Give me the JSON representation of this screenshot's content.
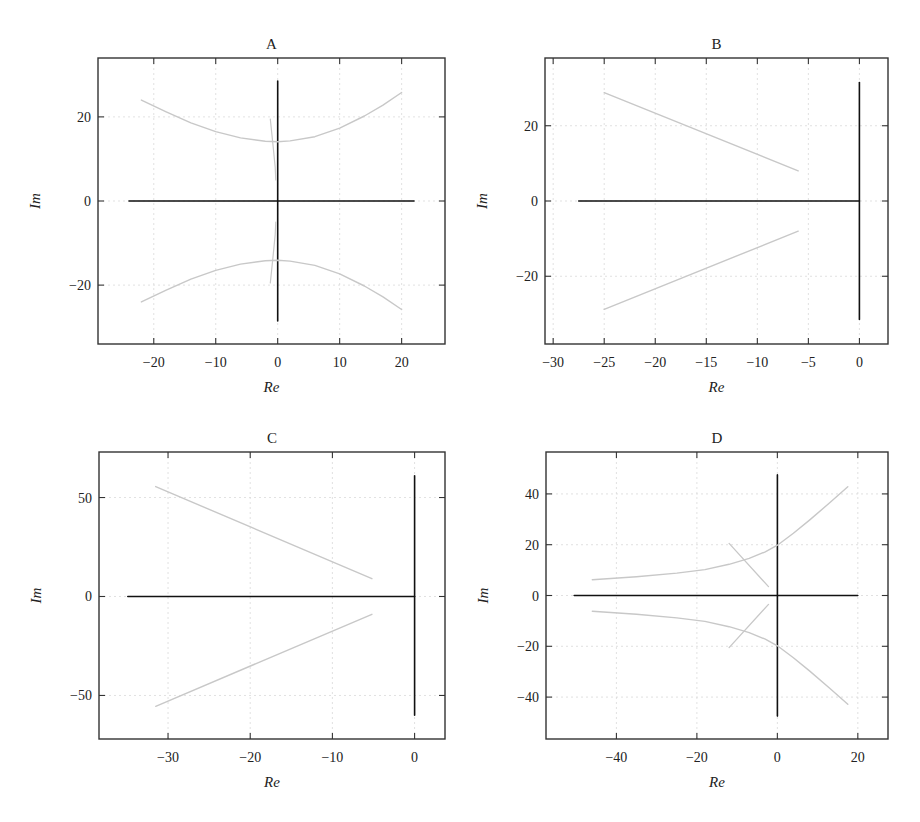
{
  "figure": {
    "background": "#ffffff",
    "frame_color": "#333333",
    "grid_color": "#d9d9d9",
    "axis_line_color": "#111111",
    "locus_color": "#c8c8c8"
  },
  "chart_data": [
    {
      "type": "line",
      "panel": "A",
      "title": "A",
      "xlabel": "Re",
      "ylabel": "Im",
      "xlim": [
        -29,
        27
      ],
      "ylim": [
        -34,
        34
      ],
      "xticks": [
        -20,
        -10,
        0,
        10,
        20
      ],
      "yticks": [
        -20,
        0,
        20
      ],
      "grid": true,
      "layout": {
        "left": 98,
        "top": 58,
        "right": 445,
        "bottom": 344
      },
      "series": [
        {
          "name": "real-axis",
          "color": "#111111",
          "width": 1.6,
          "points": [
            [
              -24,
              0
            ],
            [
              22,
              0
            ]
          ]
        },
        {
          "name": "imag-axis",
          "color": "#111111",
          "width": 1.6,
          "points": [
            [
              0,
              28.5
            ],
            [
              0,
              -28.5
            ]
          ]
        },
        {
          "name": "upper-branch",
          "color": "#c8c8c8",
          "width": 1.4,
          "points": [
            [
              -22,
              24
            ],
            [
              -18,
              21.2
            ],
            [
              -14,
              18.6
            ],
            [
              -10,
              16.5
            ],
            [
              -6,
              15
            ],
            [
              -2,
              14.2
            ],
            [
              0,
              14.1
            ],
            [
              2,
              14.3
            ],
            [
              6,
              15.3
            ],
            [
              10,
              17.3
            ],
            [
              14,
              20.2
            ],
            [
              17,
              22.8
            ],
            [
              20,
              25.8
            ]
          ]
        },
        {
          "name": "lower-branch",
          "color": "#c8c8c8",
          "width": 1.4,
          "points": [
            [
              -22,
              -24
            ],
            [
              -18,
              -21.2
            ],
            [
              -14,
              -18.6
            ],
            [
              -10,
              -16.5
            ],
            [
              -6,
              -15
            ],
            [
              -2,
              -14.2
            ],
            [
              0,
              -14.1
            ],
            [
              2,
              -14.3
            ],
            [
              6,
              -15.3
            ],
            [
              10,
              -17.3
            ],
            [
              14,
              -20.2
            ],
            [
              17,
              -22.8
            ],
            [
              20,
              -25.8
            ]
          ]
        },
        {
          "name": "near-axis-upper",
          "color": "#c8c8c8",
          "width": 1.2,
          "points": [
            [
              -1.2,
              19.5
            ],
            [
              -0.8,
              14
            ],
            [
              -0.4,
              8
            ],
            [
              -0.3,
              5
            ]
          ]
        },
        {
          "name": "near-axis-lower",
          "color": "#c8c8c8",
          "width": 1.2,
          "points": [
            [
              -0.3,
              -5
            ],
            [
              -0.4,
              -8
            ],
            [
              -0.8,
              -14
            ],
            [
              -1.2,
              -19.5
            ]
          ]
        }
      ]
    },
    {
      "type": "line",
      "panel": "B",
      "title": "B",
      "xlabel": "Re",
      "ylabel": "Im",
      "xlim": [
        -30.8,
        2.8
      ],
      "ylim": [
        -38,
        38
      ],
      "xticks": [
        -30,
        -25,
        -20,
        -15,
        -10,
        -5,
        0
      ],
      "yticks": [
        -20,
        0,
        20
      ],
      "grid": true,
      "layout": {
        "left": 545,
        "top": 58,
        "right": 888,
        "bottom": 344
      },
      "series": [
        {
          "name": "real-axis",
          "color": "#111111",
          "width": 1.6,
          "points": [
            [
              -27.5,
              0
            ],
            [
              0,
              0
            ]
          ]
        },
        {
          "name": "imag-axis",
          "color": "#111111",
          "width": 1.6,
          "points": [
            [
              0,
              31.5
            ],
            [
              0,
              -31.5
            ]
          ]
        },
        {
          "name": "upper-branch",
          "color": "#c8c8c8",
          "width": 1.4,
          "points": [
            [
              -25,
              28.8
            ],
            [
              -6,
              8
            ]
          ]
        },
        {
          "name": "lower-branch",
          "color": "#c8c8c8",
          "width": 1.4,
          "points": [
            [
              -25,
              -28.8
            ],
            [
              -6,
              -8
            ]
          ]
        }
      ]
    },
    {
      "type": "line",
      "panel": "C",
      "title": "C",
      "xlabel": "Re",
      "ylabel": "Im",
      "xlim": [
        -38.4,
        3.7
      ],
      "ylim": [
        -72,
        73
      ],
      "xticks": [
        -30,
        -20,
        -10,
        0
      ],
      "yticks": [
        -50,
        0,
        50
      ],
      "grid": true,
      "layout": {
        "left": 99,
        "top": 452,
        "right": 445,
        "bottom": 739
      },
      "series": [
        {
          "name": "real-axis",
          "color": "#111111",
          "width": 1.6,
          "points": [
            [
              -34.9,
              0
            ],
            [
              0,
              0
            ]
          ]
        },
        {
          "name": "imag-axis",
          "color": "#111111",
          "width": 1.6,
          "points": [
            [
              0,
              61
            ],
            [
              0,
              -60
            ]
          ]
        },
        {
          "name": "upper-branch",
          "color": "#c8c8c8",
          "width": 1.4,
          "points": [
            [
              -31.5,
              55.5
            ],
            [
              -5.2,
              9
            ]
          ]
        },
        {
          "name": "lower-branch",
          "color": "#c8c8c8",
          "width": 1.4,
          "points": [
            [
              -31.5,
              -55.5
            ],
            [
              -5.2,
              -9
            ]
          ]
        }
      ]
    },
    {
      "type": "line",
      "panel": "D",
      "title": "D",
      "xlabel": "Re",
      "ylabel": "Im",
      "xlim": [
        -57.5,
        27.5
      ],
      "ylim": [
        -56.5,
        56.5
      ],
      "xticks": [
        -40,
        -20,
        0,
        20
      ],
      "yticks": [
        -40,
        -20,
        0,
        20,
        40
      ],
      "grid": true,
      "layout": {
        "left": 546,
        "top": 452,
        "right": 888,
        "bottom": 739
      },
      "series": [
        {
          "name": "real-axis",
          "color": "#111111",
          "width": 1.6,
          "points": [
            [
              -50.5,
              0
            ],
            [
              20,
              0
            ]
          ]
        },
        {
          "name": "imag-axis",
          "color": "#111111",
          "width": 1.6,
          "points": [
            [
              0,
              47.5
            ],
            [
              0,
              -47.5
            ]
          ]
        },
        {
          "name": "upper-branch",
          "color": "#c8c8c8",
          "width": 1.4,
          "points": [
            [
              -46,
              6.2
            ],
            [
              -35,
              7.4
            ],
            [
              -25,
              8.8
            ],
            [
              -18,
              10.2
            ],
            [
              -12,
              12.3
            ],
            [
              -7,
              14.6
            ],
            [
              -3,
              17.2
            ],
            [
              0,
              19.8
            ],
            [
              4,
              24.5
            ],
            [
              8,
              29.7
            ],
            [
              13,
              36.5
            ],
            [
              17.5,
              42.8
            ]
          ]
        },
        {
          "name": "lower-branch",
          "color": "#c8c8c8",
          "width": 1.4,
          "points": [
            [
              -46,
              -6.2
            ],
            [
              -35,
              -7.4
            ],
            [
              -25,
              -8.8
            ],
            [
              -18,
              -10.2
            ],
            [
              -12,
              -12.3
            ],
            [
              -7,
              -14.6
            ],
            [
              -3,
              -17.2
            ],
            [
              0,
              -19.8
            ],
            [
              4,
              -24.5
            ],
            [
              8,
              -29.7
            ],
            [
              13,
              -36.5
            ],
            [
              17.5,
              -42.8
            ]
          ]
        },
        {
          "name": "crossing-upper",
          "color": "#c8c8c8",
          "width": 1.3,
          "points": [
            [
              -12,
              20.5
            ],
            [
              -2.2,
              3.5
            ]
          ]
        },
        {
          "name": "crossing-lower",
          "color": "#c8c8c8",
          "width": 1.3,
          "points": [
            [
              -12,
              -20.5
            ],
            [
              -2.2,
              -3.5
            ]
          ]
        }
      ]
    }
  ]
}
